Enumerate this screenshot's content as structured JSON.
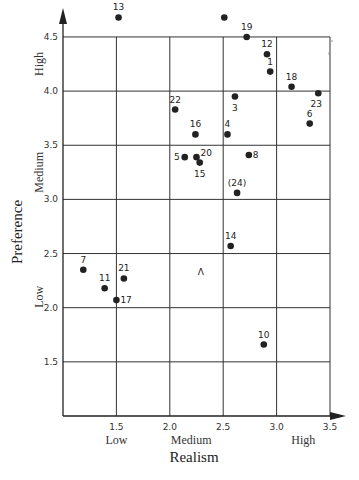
{
  "chart_data": {
    "type": "scatter",
    "title": "",
    "xlabel": "Realism",
    "ylabel": "Preference",
    "xlim": [
      1.0,
      3.5
    ],
    "ylim": [
      1.0,
      4.5
    ],
    "grid": true,
    "x_ticks": [
      "1.5",
      "2.0",
      "2.5",
      "3.0",
      "3.5"
    ],
    "y_ticks": [
      "4.5",
      "4.0",
      "3.5",
      "3.0",
      "2.5",
      "2.0",
      "1.5"
    ],
    "x_categories": [
      {
        "label": "Low",
        "at": 1.5
      },
      {
        "label": "Medium",
        "at": 2.2
      },
      {
        "label": "High",
        "at": 3.25
      }
    ],
    "y_categories": [
      {
        "label": "High",
        "at": 4.25
      },
      {
        "label": "Medium",
        "at": 3.25
      },
      {
        "label": "Low",
        "at": 2.1
      }
    ],
    "points": [
      {
        "label": "13",
        "x": 1.52,
        "y": 4.68,
        "lx": 0,
        "ly": -7,
        "anchor": "middle"
      },
      {
        "label": "",
        "x": 2.51,
        "y": 4.68,
        "lx": 0,
        "ly": 0,
        "anchor": "middle"
      },
      {
        "label": "19",
        "x": 2.72,
        "y": 4.5,
        "lx": 0,
        "ly": -7,
        "anchor": "middle"
      },
      {
        "label": "12",
        "x": 2.91,
        "y": 4.34,
        "lx": 0,
        "ly": -7,
        "anchor": "middle"
      },
      {
        "label": "1",
        "x": 2.94,
        "y": 4.18,
        "lx": 0,
        "ly": -7,
        "anchor": "middle"
      },
      {
        "label": "18",
        "x": 3.14,
        "y": 4.04,
        "lx": 0,
        "ly": -7,
        "anchor": "middle"
      },
      {
        "label": "23",
        "x": 3.39,
        "y": 3.98,
        "lx": -2,
        "ly": 14,
        "anchor": "middle"
      },
      {
        "label": "6",
        "x": 3.31,
        "y": 3.7,
        "lx": 0,
        "ly": -7,
        "anchor": "middle"
      },
      {
        "label": "3",
        "x": 2.61,
        "y": 3.95,
        "lx": 0,
        "ly": 14,
        "anchor": "middle"
      },
      {
        "label": "22",
        "x": 2.05,
        "y": 3.83,
        "lx": 0,
        "ly": -7,
        "anchor": "middle"
      },
      {
        "label": "16",
        "x": 2.24,
        "y": 3.6,
        "lx": 0,
        "ly": -7,
        "anchor": "middle"
      },
      {
        "label": "4",
        "x": 2.54,
        "y": 3.6,
        "lx": 0,
        "ly": -7,
        "anchor": "middle"
      },
      {
        "label": "5",
        "x": 2.14,
        "y": 3.39,
        "lx": -5,
        "ly": 0,
        "anchor": "end"
      },
      {
        "label": "20",
        "x": 2.25,
        "y": 3.39,
        "lx": 4,
        "ly": -1,
        "anchor": "start"
      },
      {
        "label": "15",
        "x": 2.28,
        "y": 3.34,
        "lx": 0,
        "ly": 14,
        "anchor": "middle"
      },
      {
        "label": "8",
        "x": 2.74,
        "y": 3.41,
        "lx": 4,
        "ly": 0,
        "anchor": "start"
      },
      {
        "label": "(24)",
        "x": 2.63,
        "y": 3.06,
        "lx": 0,
        "ly": -7,
        "anchor": "middle"
      },
      {
        "label": "14",
        "x": 2.57,
        "y": 2.57,
        "lx": 0,
        "ly": -7,
        "anchor": "middle"
      },
      {
        "label": "7",
        "x": 1.19,
        "y": 2.35,
        "lx": 0,
        "ly": -7,
        "anchor": "middle"
      },
      {
        "label": "11",
        "x": 1.39,
        "y": 2.18,
        "lx": 0,
        "ly": -7,
        "anchor": "middle"
      },
      {
        "label": "21",
        "x": 1.57,
        "y": 2.27,
        "lx": 0,
        "ly": -7,
        "anchor": "middle"
      },
      {
        "label": "17",
        "x": 1.5,
        "y": 2.07,
        "lx": 4,
        "ly": 0,
        "anchor": "start"
      },
      {
        "label": "10",
        "x": 2.88,
        "y": 1.66,
        "lx": 0,
        "ly": -7,
        "anchor": "middle"
      }
    ],
    "annotations": [
      {
        "text": "Λ",
        "x": 2.29,
        "y": 2.33
      }
    ]
  },
  "colors": {
    "grid": "#333333",
    "point": "#222222",
    "background": "#ffffff"
  }
}
